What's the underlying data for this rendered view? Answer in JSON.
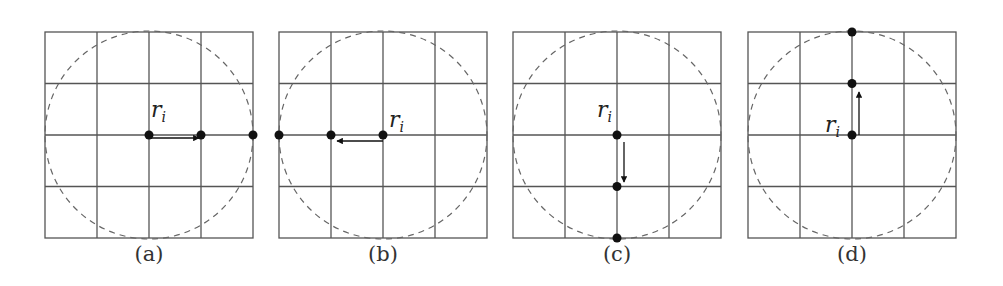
{
  "figure": {
    "panels": [
      {
        "id": "a",
        "caption": "(a)",
        "label": "r",
        "label_sub": "i",
        "direction": "right",
        "x": 45
      },
      {
        "id": "b",
        "caption": "(b)",
        "label": "r",
        "label_sub": "i",
        "direction": "left",
        "x": 279
      },
      {
        "id": "c",
        "caption": "(c)",
        "label": "r",
        "label_sub": "i",
        "direction": "down",
        "x": 512
      },
      {
        "id": "d",
        "caption": "(d)",
        "label": "r",
        "label_sub": "i",
        "direction": "up",
        "x": 748
      }
    ],
    "grid": {
      "rows": 4,
      "cols": 4,
      "cell_px": 52,
      "top": 32
    },
    "colors": {
      "grid": "#555555",
      "circle": "#666666",
      "point": "#111111"
    }
  }
}
